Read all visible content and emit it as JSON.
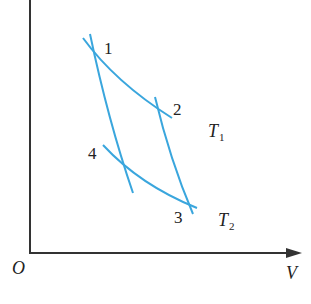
{
  "diagram": {
    "type": "p-V diagram (Carnot cycle)",
    "axes": {
      "origin_label": "O",
      "x_label": "V",
      "y_axis": "vertical axis (unlabeled in view)"
    },
    "points": [
      {
        "id": "1",
        "label": "1"
      },
      {
        "id": "2",
        "label": "2"
      },
      {
        "id": "3",
        "label": "3"
      },
      {
        "id": "4",
        "label": "4"
      }
    ],
    "isotherms": [
      {
        "name": "T",
        "sub": "1",
        "from": "1",
        "to": "2"
      },
      {
        "name": "T",
        "sub": "2",
        "from": "4",
        "to": "3"
      }
    ],
    "adiabats": [
      {
        "from": "1",
        "to": "4"
      },
      {
        "from": "2",
        "to": "3"
      }
    ],
    "colors": {
      "curve": "#3aa6dd",
      "axis": "#333333",
      "text": "#222222"
    }
  }
}
